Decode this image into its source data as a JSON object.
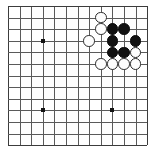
{
  "board": {
    "name": "go-board",
    "size": 13,
    "columns": 13,
    "rows": 13,
    "origin_x": 8,
    "origin_y": 6,
    "spacing": 11.6,
    "line_color": "#5a5a5a",
    "edge_color": "#3c3c3c",
    "background_color": "#ffffff",
    "star_points": [
      {
        "col": 3,
        "row": 3
      },
      {
        "col": 3,
        "row": 9
      },
      {
        "col": 9,
        "row": 9
      }
    ],
    "stones": [
      {
        "col": 8,
        "row": 1,
        "color": "white"
      },
      {
        "col": 8,
        "row": 2,
        "color": "white"
      },
      {
        "col": 9,
        "row": 2,
        "color": "black"
      },
      {
        "col": 10,
        "row": 2,
        "color": "black"
      },
      {
        "col": 7,
        "row": 3,
        "color": "white"
      },
      {
        "col": 9,
        "row": 3,
        "color": "black"
      },
      {
        "col": 11,
        "row": 3,
        "color": "black"
      },
      {
        "col": 9,
        "row": 4,
        "color": "black"
      },
      {
        "col": 10,
        "row": 4,
        "color": "black"
      },
      {
        "col": 11,
        "row": 4,
        "color": "white"
      },
      {
        "col": 8,
        "row": 5,
        "color": "white"
      },
      {
        "col": 9,
        "row": 5,
        "color": "white"
      },
      {
        "col": 10,
        "row": 5,
        "color": "white"
      },
      {
        "col": 11,
        "row": 5,
        "color": "white"
      }
    ],
    "stone_diameter": 11.6,
    "black_color": "#121212",
    "white_color": "#fdfdfd"
  }
}
